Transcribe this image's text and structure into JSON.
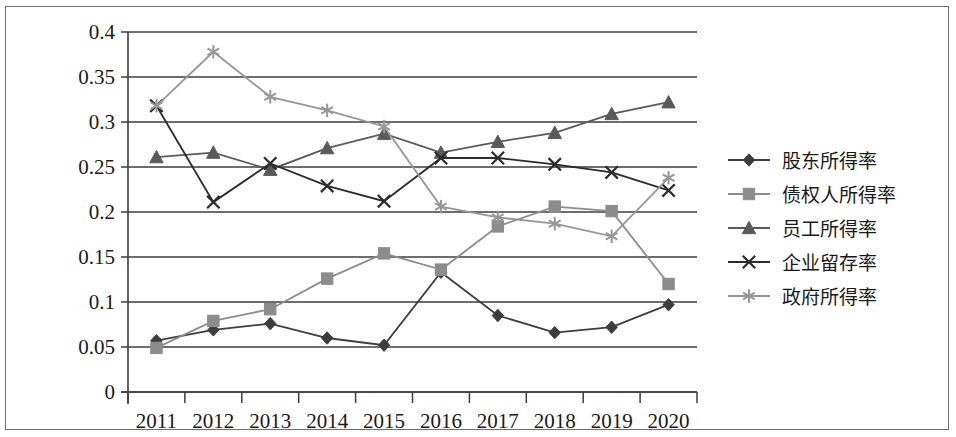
{
  "chart_data": {
    "type": "line",
    "title": "",
    "xlabel": "",
    "ylabel": "",
    "categories": [
      "2011",
      "2012",
      "2013",
      "2014",
      "2015",
      "2016",
      "2017",
      "2018",
      "2019",
      "2020"
    ],
    "ylim": [
      0,
      0.4
    ],
    "ytick_labels": [
      "0",
      "0.05",
      "0.1",
      "0.15",
      "0.2",
      "0.25",
      "0.3",
      "0.35",
      "0.4"
    ],
    "ytick_values": [
      0,
      0.05,
      0.1,
      0.15,
      0.2,
      0.25,
      0.3,
      0.35,
      0.4
    ],
    "grid": true,
    "legend_position": "right",
    "series": [
      {
        "name": "股东所得率",
        "marker": "diamond",
        "color": "#3d3d3d",
        "values": [
          0.057,
          0.069,
          0.076,
          0.06,
          0.052,
          0.133,
          0.085,
          0.066,
          0.072,
          0.097
        ]
      },
      {
        "name": "债权人所得率",
        "marker": "square",
        "color": "#8c8c8c",
        "values": [
          0.049,
          0.079,
          0.092,
          0.126,
          0.154,
          0.136,
          0.184,
          0.206,
          0.201,
          0.12
        ]
      },
      {
        "name": "员工所得率",
        "marker": "triangle",
        "color": "#5a5a5a",
        "values": [
          0.261,
          0.266,
          0.247,
          0.271,
          0.287,
          0.266,
          0.278,
          0.288,
          0.309,
          0.322
        ]
      },
      {
        "name": "企业留存率",
        "marker": "cross",
        "color": "#2b2b2b",
        "values": [
          0.318,
          0.211,
          0.254,
          0.229,
          0.212,
          0.26,
          0.26,
          0.253,
          0.244,
          0.224
        ]
      },
      {
        "name": "政府所得率",
        "marker": "asterisk",
        "color": "#979797",
        "values": [
          0.318,
          0.378,
          0.328,
          0.313,
          0.295,
          0.206,
          0.194,
          0.187,
          0.173,
          0.238
        ]
      }
    ]
  },
  "legend": {
    "items": [
      {
        "label": "股东所得率",
        "marker": "diamond-marker-icon"
      },
      {
        "label": "债权人所得率",
        "marker": "square-marker-icon"
      },
      {
        "label": "员工所得率",
        "marker": "triangle-marker-icon"
      },
      {
        "label": "企业留存率",
        "marker": "cross-marker-icon"
      },
      {
        "label": "政府所得率",
        "marker": "asterisk-marker-icon"
      }
    ]
  },
  "colors": {
    "axis": "#3d3d3d",
    "frame": "#6e6e6e",
    "text": "#1a1a1a",
    "background": "#ffffff"
  }
}
